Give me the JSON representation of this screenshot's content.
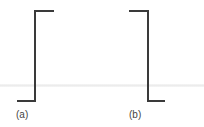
{
  "figure": {
    "line_color": "#3a3a3a",
    "panels": [
      {
        "label": "(a)",
        "shape": "step-up",
        "points": [
          [
            17,
            101
          ],
          [
            35,
            101
          ],
          [
            35,
            11
          ],
          [
            54,
            11
          ]
        ]
      },
      {
        "label": "(b)",
        "shape": "step-down",
        "points": [
          [
            129,
            11
          ],
          [
            148,
            11
          ],
          [
            148,
            101
          ],
          [
            165,
            101
          ]
        ]
      }
    ]
  }
}
